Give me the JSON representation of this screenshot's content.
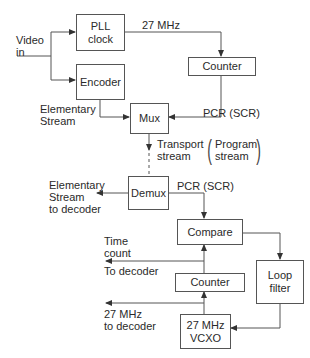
{
  "diagram": {
    "blocks": {
      "pll_clock": "PLL\nclock",
      "encoder": "Encoder",
      "counter_enc": "Counter",
      "mux": "Mux",
      "demux": "Demux",
      "compare": "Compare",
      "loop_filter": "Loop\nfilter",
      "counter_dec": "Counter",
      "vcxo": "27 MHz\nVCXO"
    },
    "labels": {
      "video_in": "Video\nin",
      "pll_out": "27 MHz",
      "elementary_stream_in": "Elementary\nStream",
      "pcr_enc": "PCR (SCR)",
      "transport_stream": "Transport\nstream",
      "program_stream": "Program\nstream",
      "elementary_stream_out": "Elementary\nStream\nto decoder",
      "pcr_dec": "PCR (SCR)",
      "time_count": "Time\ncount",
      "to_decoder": "To decoder",
      "clock_to_decoder": "27 MHz\nto decoder"
    },
    "line_color": "#555555",
    "text_color": "#2a2a2a"
  }
}
